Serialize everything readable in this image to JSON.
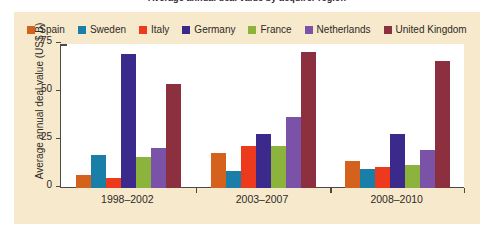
{
  "figure": {
    "partial_title": "Average annual deal value by acquirer region",
    "background_color": "#f7e9cc",
    "plot_background_color": "#ffffff"
  },
  "chart_data": {
    "type": "bar",
    "title": "",
    "xlabel": "",
    "ylabel": "Average annual deal value (US$ B)",
    "categories": [
      "1998–2002",
      "2003–2007",
      "2008–2010"
    ],
    "ylim": [
      0,
      75
    ],
    "yticks": [
      0,
      25,
      50,
      75
    ],
    "ytick_labels": [
      "0",
      "25",
      "50",
      "75"
    ],
    "grid": false,
    "legend_position": "top",
    "series": [
      {
        "name": "Spain",
        "color": "#d4621c",
        "values": [
          7,
          18,
          14
        ]
      },
      {
        "name": "Sweden",
        "color": "#1a7fa8",
        "values": [
          17,
          9,
          10
        ]
      },
      {
        "name": "Italy",
        "color": "#ee3a1c",
        "values": [
          5,
          22,
          11
        ]
      },
      {
        "name": "Germany",
        "color": "#3b2a8c",
        "values": [
          70,
          28,
          28
        ]
      },
      {
        "name": "France",
        "color": "#8cb43c",
        "values": [
          16,
          22,
          12
        ]
      },
      {
        "name": "Netherlands",
        "color": "#7a52a8",
        "values": [
          21,
          37,
          20
        ]
      },
      {
        "name": "United Kingdom",
        "color": "#8c3040",
        "values": [
          54,
          71,
          66
        ]
      }
    ]
  }
}
